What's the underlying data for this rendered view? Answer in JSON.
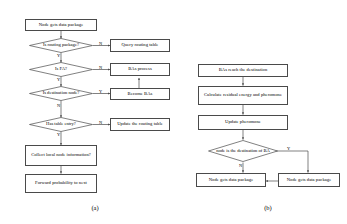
{
  "figure": {
    "panels": [
      {
        "id": "a",
        "caption": "(a)",
        "nodes": {
          "start": "Node gets data package",
          "d_routing": "Is routing package?",
          "query_table": "Query routing table",
          "d_fa": "Is FA?",
          "bas_process": "BAs process",
          "d_dest": "Is destination node?",
          "become_bas": "Become BAs",
          "d_table_entry": "Has table entry?",
          "update_table": "Update the routing table",
          "collect_info": "Collect local node information?",
          "forward": "Forward probability to next"
        },
        "edge_labels": {
          "routing_no": "N",
          "routing_yes": "Y",
          "fa_no": "N",
          "fa_yes": "Y",
          "dest_yes": "Y",
          "dest_no": "N",
          "entry_no": "N",
          "entry_yes": "Y"
        }
      },
      {
        "id": "b",
        "caption": "(b)",
        "nodes": {
          "reach_dest": "BAs reach the destination",
          "calc_energy": "Calculate residual energy and pheromone",
          "update_pheromone": "Update pheromone",
          "d_is_dest": "node is the destination of BA",
          "get_left": "Node gets data package",
          "get_right": "Node gets data package"
        },
        "edge_labels": {
          "is_dest_yes": "Y",
          "is_dest_no": "N"
        }
      }
    ]
  },
  "colors": {
    "stroke": "#4a4a4a",
    "background": "#ffffff",
    "text": "#000000"
  }
}
